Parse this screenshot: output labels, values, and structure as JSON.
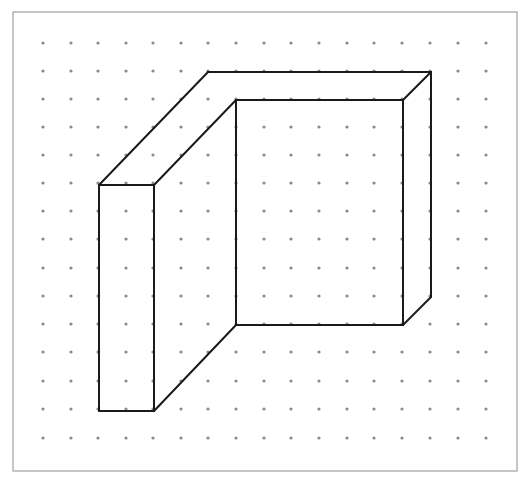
{
  "diagram": {
    "title": "",
    "border": {
      "x": 13,
      "y": 12,
      "w": 504,
      "h": 459,
      "color": "#a0a0a0"
    },
    "dots": {
      "xs": [
        43,
        71,
        98,
        126,
        153,
        181,
        208,
        236,
        264,
        291,
        319,
        347,
        374,
        402,
        430,
        458,
        486
      ],
      "ys": [
        43,
        71,
        99,
        127,
        155,
        183,
        211,
        239,
        268,
        296,
        324,
        352,
        381,
        409,
        438
      ],
      "color": "#8a8a8a",
      "radius": 1.6
    },
    "line_color": "#1a1a1a",
    "line_width": 2,
    "edges": [
      [
        [
          99,
          185
        ],
        [
          154,
          185
        ]
      ],
      [
        [
          99,
          185
        ],
        [
          99,
          411
        ]
      ],
      [
        [
          99,
          411
        ],
        [
          154,
          411
        ]
      ],
      [
        [
          154,
          185
        ],
        [
          154,
          411
        ]
      ],
      [
        [
          99,
          185
        ],
        [
          208,
          72
        ]
      ],
      [
        [
          208,
          72
        ],
        [
          431,
          72
        ]
      ],
      [
        [
          154,
          185
        ],
        [
          236,
          100
        ]
      ],
      [
        [
          236,
          100
        ],
        [
          403,
          100
        ]
      ],
      [
        [
          403,
          100
        ],
        [
          431,
          72
        ]
      ],
      [
        [
          236,
          100
        ],
        [
          236,
          325
        ]
      ],
      [
        [
          403,
          100
        ],
        [
          403,
          325
        ]
      ],
      [
        [
          431,
          72
        ],
        [
          431,
          297
        ]
      ],
      [
        [
          431,
          297
        ],
        [
          403,
          325
        ]
      ],
      [
        [
          236,
          325
        ],
        [
          403,
          325
        ]
      ],
      [
        [
          154,
          411
        ],
        [
          236,
          325
        ]
      ]
    ]
  }
}
